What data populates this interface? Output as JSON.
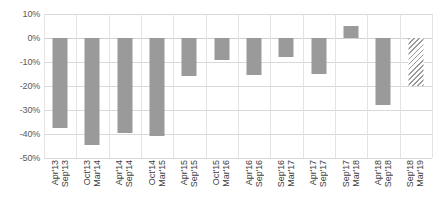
{
  "chart_data": {
    "type": "bar",
    "title": "",
    "xlabel": "",
    "ylabel": "",
    "ylim": [
      -50,
      10
    ],
    "ytick_labels": [
      "10%",
      "0%",
      "-10%",
      "-20%",
      "-30%",
      "-40%",
      "-50%"
    ],
    "ytick_values": [
      10,
      0,
      -10,
      -20,
      -30,
      -40,
      -50
    ],
    "grid": true,
    "legend": "none",
    "bar_color": "#9a9a9a",
    "forecast_style": "hatched",
    "categories": [
      "Apr'13 Sep'13",
      "Oct'13 Mar'14",
      "Apr'14 Sep'14",
      "Oct'14 Mar'15",
      "Apr'15 Sep'15",
      "Oct'15 Mar'16",
      "Apr'16 Sep'16",
      "Sep'16 Mar'17",
      "Apr'17 Sep'17",
      "Sep'17 Mar'18",
      "Apr'18 Sep'18",
      "Sep'18 Mar'19"
    ],
    "category_lines": [
      [
        "Apr'13",
        "Sep'13"
      ],
      [
        "Oct'13",
        "Mar'14"
      ],
      [
        "Apr'14",
        "Sep'14"
      ],
      [
        "Oct'14",
        "Mar'15"
      ],
      [
        "Apr'15",
        "Sep'15"
      ],
      [
        "Oct'15",
        "Mar'16"
      ],
      [
        "Apr'16",
        "Sep'16"
      ],
      [
        "Sep'16",
        "Mar'17"
      ],
      [
        "Apr'17",
        "Sep'17"
      ],
      [
        "Sep'17",
        "Mar'18"
      ],
      [
        "Apr'18",
        "Sep'18"
      ],
      [
        "Sep'18",
        "Mar'19"
      ]
    ],
    "values": [
      -37.5,
      -44.5,
      -39.5,
      -41,
      -16,
      -9,
      -15.5,
      -8,
      -15,
      5,
      -28,
      -20
    ],
    "forecast_flags": [
      false,
      false,
      false,
      false,
      false,
      false,
      false,
      false,
      false,
      false,
      false,
      true
    ]
  }
}
